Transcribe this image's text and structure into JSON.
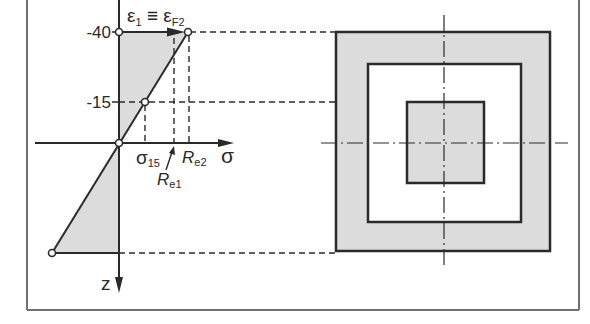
{
  "diagram": {
    "left_plot": {
      "strain_label": {
        "eps1": "ε",
        "eps1_sub": "1",
        "equiv": " ≡ ",
        "epsF2": "ε",
        "epsF2_sub": "F2"
      },
      "z_ticks": [
        {
          "label": "-40"
        },
        {
          "label": "-15"
        }
      ],
      "x_axis_label": "σ",
      "z_axis_label": "z",
      "markers": {
        "sigma15": {
          "main": "σ",
          "sub": "15"
        },
        "Re1": {
          "main": "R",
          "sub": "e1"
        },
        "Re2": {
          "main": "R",
          "sub": "e2"
        }
      }
    },
    "cross_section": {
      "shape": "nested squares",
      "layers": [
        "outer shaded ring",
        "white ring",
        "inner shaded core"
      ]
    }
  },
  "colors": {
    "fill": "#dcdcdc",
    "line": "#2a2a2a",
    "frame": "#707070",
    "background": "#ffffff"
  }
}
